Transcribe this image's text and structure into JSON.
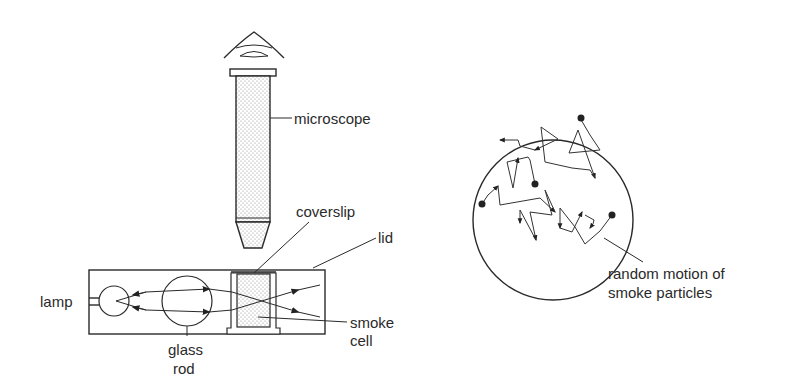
{
  "diagram": {
    "labels": {
      "microscope": "microscope",
      "coverslip": "coverslip",
      "lid": "lid",
      "lamp": "lamp",
      "glass_rod_line1": "glass",
      "glass_rod_line2": "rod",
      "smoke_cell_line1": "smoke",
      "smoke_cell_line2": "cell",
      "random_motion_line1": "random motion of",
      "random_motion_line2": "smoke particles"
    },
    "components": [
      {
        "name": "eye",
        "icon": "eye-icon"
      },
      {
        "name": "microscope",
        "icon": "microscope-tube"
      },
      {
        "name": "lamp",
        "icon": "lamp-circle"
      },
      {
        "name": "glass rod",
        "icon": "lens-circle"
      },
      {
        "name": "smoke cell",
        "icon": "cell-box"
      },
      {
        "name": "field of view",
        "icon": "circle-view"
      }
    ],
    "colors": {
      "line": "#2a2a2a",
      "background": "#ffffff",
      "stipple": "#9a9a9a"
    }
  }
}
